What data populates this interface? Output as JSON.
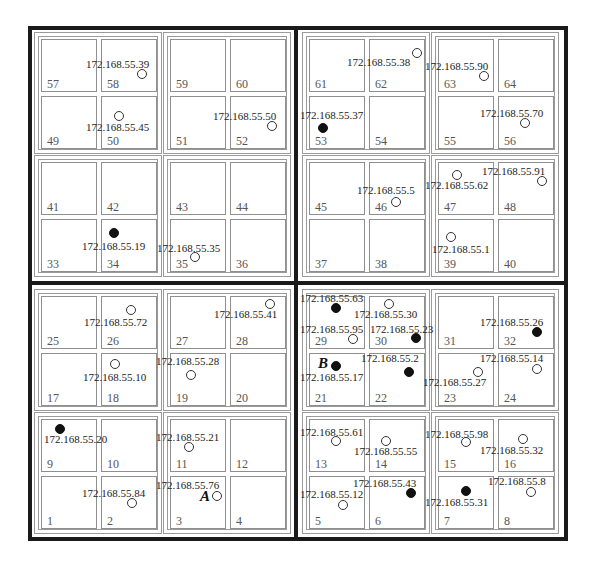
{
  "diagram": {
    "grid": {
      "columns": 8,
      "rows": 8,
      "cell_numbers_rows_top_to_bottom": [
        [
          57,
          58,
          59,
          60,
          61,
          62,
          63,
          64
        ],
        [
          49,
          50,
          51,
          52,
          53,
          54,
          55,
          56
        ],
        [
          41,
          42,
          43,
          44,
          45,
          46,
          47,
          48
        ],
        [
          33,
          34,
          35,
          36,
          37,
          38,
          39,
          40
        ],
        [
          25,
          26,
          27,
          28,
          29,
          30,
          31,
          32
        ],
        [
          17,
          18,
          19,
          20,
          21,
          22,
          23,
          24
        ],
        [
          9,
          10,
          11,
          12,
          13,
          14,
          15,
          16
        ],
        [
          1,
          2,
          3,
          4,
          5,
          6,
          7,
          8
        ]
      ]
    },
    "markers": [
      {
        "label": "A",
        "x": 205,
        "y": 496
      },
      {
        "label": "B",
        "x": 323,
        "y": 363
      }
    ],
    "nodes": [
      {
        "ip": "172.168.55.39",
        "type": "open",
        "x": 142,
        "y": 74,
        "lx": 86,
        "ly": 64
      },
      {
        "ip": "172.168.55.45",
        "type": "open",
        "x": 119,
        "y": 116,
        "lx": 86,
        "ly": 127
      },
      {
        "ip": "172.168.55.50",
        "type": "open",
        "x": 272,
        "y": 126,
        "lx": 213,
        "ly": 116
      },
      {
        "ip": "172.168.55.38",
        "type": "open",
        "x": 417,
        "y": 53,
        "lx": 347,
        "ly": 62
      },
      {
        "ip": "172.168.55.37",
        "type": "filled",
        "x": 323,
        "y": 128,
        "lx": 300,
        "ly": 115
      },
      {
        "ip": "172.168.55.90",
        "type": "open",
        "x": 484,
        "y": 76,
        "lx": 425,
        "ly": 66
      },
      {
        "ip": "172.168.55.70",
        "type": "open",
        "x": 525,
        "y": 123,
        "lx": 480,
        "ly": 113
      },
      {
        "ip": "172.168.55.19",
        "type": "filled",
        "x": 114,
        "y": 233,
        "lx": 82,
        "ly": 246
      },
      {
        "ip": "172.168.55.35",
        "type": "open",
        "x": 195,
        "y": 257,
        "lx": 157,
        "ly": 248
      },
      {
        "ip": "172.168.55.5",
        "type": "open",
        "x": 396,
        "y": 202,
        "lx": 357,
        "ly": 190
      },
      {
        "ip": "172.168.55.62",
        "type": "open",
        "x": 457,
        "y": 175,
        "lx": 425,
        "ly": 185
      },
      {
        "ip": "172.168.55.91",
        "type": "open",
        "x": 542,
        "y": 181,
        "lx": 482,
        "ly": 171
      },
      {
        "ip": "172.168.55.1",
        "type": "open",
        "x": 451,
        "y": 237,
        "lx": 432,
        "ly": 249
      },
      {
        "ip": "172.168.55.72",
        "type": "open",
        "x": 131,
        "y": 310,
        "lx": 84,
        "ly": 322
      },
      {
        "ip": "172.168.55.10",
        "type": "open",
        "x": 115,
        "y": 364,
        "lx": 83,
        "ly": 377
      },
      {
        "ip": "172.168.55.41",
        "type": "open",
        "x": 270,
        "y": 304,
        "lx": 214,
        "ly": 314
      },
      {
        "ip": "172.168.55.28",
        "type": "open",
        "x": 191,
        "y": 375,
        "lx": 156,
        "ly": 361
      },
      {
        "ip": "172.168.55.63",
        "type": "filled",
        "x": 336,
        "y": 308,
        "lx": 300,
        "ly": 298
      },
      {
        "ip": "172.168.55.30",
        "type": "open",
        "x": 389,
        "y": 304,
        "lx": 354,
        "ly": 314
      },
      {
        "ip": "172.168.55.95",
        "type": "open",
        "x": 353,
        "y": 339,
        "lx": 300,
        "ly": 329
      },
      {
        "ip": "172.168.55.23",
        "type": "filled",
        "x": 416,
        "y": 338,
        "lx": 370,
        "ly": 329
      },
      {
        "ip": "172.168.55.17",
        "type": "filled",
        "x": 336,
        "y": 366,
        "lx": 300,
        "ly": 377
      },
      {
        "ip": "172.168.55.2",
        "type": "filled",
        "x": 409,
        "y": 372,
        "lx": 361,
        "ly": 358
      },
      {
        "ip": "172.168.55.26",
        "type": "filled",
        "x": 537,
        "y": 332,
        "lx": 480,
        "ly": 322
      },
      {
        "ip": "172.168.55.14",
        "type": "open",
        "x": 537,
        "y": 369,
        "lx": 480,
        "ly": 358
      },
      {
        "ip": "172.168.55.27",
        "type": "open",
        "x": 478,
        "y": 372,
        "lx": 423,
        "ly": 382
      },
      {
        "ip": "172.168.55.20",
        "type": "filled",
        "x": 60,
        "y": 429,
        "lx": 44,
        "ly": 439
      },
      {
        "ip": "172.168.55.84",
        "type": "open",
        "x": 132,
        "y": 503,
        "lx": 82,
        "ly": 493
      },
      {
        "ip": "172.168.55.21",
        "type": "open",
        "x": 189,
        "y": 447,
        "lx": 156,
        "ly": 437
      },
      {
        "ip": "172.168.55.76",
        "type": "open",
        "x": 217,
        "y": 496,
        "lx": 156,
        "ly": 485
      },
      {
        "ip": "172.168.55.61",
        "type": "open",
        "x": 336,
        "y": 441,
        "lx": 300,
        "ly": 432
      },
      {
        "ip": "172.168.55.55",
        "type": "open",
        "x": 386,
        "y": 441,
        "lx": 354,
        "ly": 451
      },
      {
        "ip": "172.168.55.43",
        "type": "filled",
        "x": 411,
        "y": 493,
        "lx": 353,
        "ly": 483
      },
      {
        "ip": "172.168.55.12",
        "type": "open",
        "x": 343,
        "y": 505,
        "lx": 300,
        "ly": 494
      },
      {
        "ip": "172.168.55.98",
        "type": "open",
        "x": 466,
        "y": 442,
        "lx": 425,
        "ly": 434
      },
      {
        "ip": "172.168.55.32",
        "type": "open",
        "x": 523,
        "y": 439,
        "lx": 480,
        "ly": 450
      },
      {
        "ip": "172.168.55.31",
        "type": "filled",
        "x": 466,
        "y": 491,
        "lx": 425,
        "ly": 502
      },
      {
        "ip": "172.168.55.8",
        "type": "open",
        "x": 531,
        "y": 492,
        "lx": 488,
        "ly": 481
      }
    ]
  }
}
